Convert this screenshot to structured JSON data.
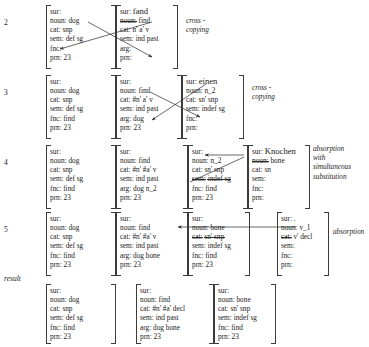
{
  "figure": {
    "kind": "derivation-table",
    "rows": [
      {
        "number": "2",
        "label": "",
        "note": "cross - copying",
        "proplists": [
          {
            "name": "dog-proplist",
            "lines": [
              {
                "key": "sur:",
                "value": ""
              },
              {
                "key": "noun:",
                "value": "dog"
              },
              {
                "key": "cat:",
                "value": "snp"
              },
              {
                "key": "sem:",
                "value": "def sg"
              },
              {
                "key": "fnc:",
                "value": ""
              },
              {
                "key": "prn:",
                "value": "23"
              }
            ]
          },
          {
            "name": "fand-proplist",
            "lines": [
              {
                "key": "sur:",
                "value": "fand",
                "value_big": true
              },
              {
                "key": "noun:",
                "value": "find",
                "key_struck": true
              },
              {
                "key": "cat:",
                "value": "n' a' v"
              },
              {
                "key": "sem:",
                "value": "ind past"
              },
              {
                "key": "arg:",
                "value": ""
              },
              {
                "key": "prn:",
                "value": ""
              }
            ]
          }
        ]
      },
      {
        "number": "3",
        "label": "",
        "note": "cross - copying",
        "proplists": [
          {
            "name": "dog-proplist",
            "lines": [
              {
                "key": "sur:",
                "value": ""
              },
              {
                "key": "noun:",
                "value": "dog"
              },
              {
                "key": "cat:",
                "value": "snp"
              },
              {
                "key": "sem:",
                "value": "def sg"
              },
              {
                "key": "fnc:",
                "value": "find"
              },
              {
                "key": "prn:",
                "value": "23"
              }
            ]
          },
          {
            "name": "find-proplist",
            "lines": [
              {
                "key": "sur:",
                "value": ""
              },
              {
                "key": "noun:",
                "value": "find"
              },
              {
                "key": "cat:",
                "value": "#n' a' v"
              },
              {
                "key": "sem:",
                "value": "ind past"
              },
              {
                "key": "arg:",
                "value": "dog"
              },
              {
                "key": "prn:",
                "value": "23"
              }
            ]
          },
          {
            "name": "einen-proplist",
            "lines": [
              {
                "key": "sur:",
                "value": "einen"
              },
              {
                "key": "noun:",
                "value": "n_2"
              },
              {
                "key": "cat:",
                "value": "sn' snp"
              },
              {
                "key": "sem:",
                "value": "indef sg"
              },
              {
                "key": "fnc:",
                "value": ""
              },
              {
                "key": "prn:",
                "value": ""
              }
            ]
          }
        ]
      },
      {
        "number": "4",
        "label": "",
        "note": "absorption with\nsimultaneous\nsubstitution",
        "proplists": [
          {
            "name": "dog-proplist",
            "lines": [
              {
                "key": "sur:",
                "value": ""
              },
              {
                "key": "noun:",
                "value": "dog"
              },
              {
                "key": "cat:",
                "value": "snp"
              },
              {
                "key": "sem:",
                "value": "def sg"
              },
              {
                "key": "fnc:",
                "value": "find"
              },
              {
                "key": "prn:",
                "value": "23"
              }
            ]
          },
          {
            "name": "find-proplist",
            "lines": [
              {
                "key": "sur:",
                "value": ""
              },
              {
                "key": "noun:",
                "value": "find"
              },
              {
                "key": "cat:",
                "value": "#n' #a' v"
              },
              {
                "key": "sem:",
                "value": "ind past"
              },
              {
                "key": "arg:",
                "value": "dog n_2"
              },
              {
                "key": "prn:",
                "value": "23"
              }
            ]
          },
          {
            "name": "n2-proplist",
            "lines": [
              {
                "key": "sur:",
                "value": ""
              },
              {
                "key": "noun:",
                "value": "n_2"
              },
              {
                "key": "cat:",
                "value": "sn' snp"
              },
              {
                "key": "sem:",
                "value": "indef sg",
                "key_struck": true,
                "value_struck": true
              },
              {
                "key": "fnc:",
                "value": "find"
              },
              {
                "key": "prn:",
                "value": "23"
              }
            ]
          },
          {
            "name": "knochen-proplist",
            "lines": [
              {
                "key": "sur:",
                "value": "Knochen",
                "value_big": true
              },
              {
                "key": "noun:",
                "value": "bone",
                "key_struck": true
              },
              {
                "key": "cat:",
                "value": "sn"
              },
              {
                "key": "sem:",
                "value": ""
              },
              {
                "key": "fnc:",
                "value": ""
              },
              {
                "key": "prn:",
                "value": ""
              }
            ]
          }
        ]
      },
      {
        "number": "5",
        "label": "",
        "note": "absorption",
        "proplists": [
          {
            "name": "dog-proplist",
            "lines": [
              {
                "key": "sur:",
                "value": ""
              },
              {
                "key": "noun:",
                "value": "dog"
              },
              {
                "key": "cat:",
                "value": "snp"
              },
              {
                "key": "sem:",
                "value": "def sg"
              },
              {
                "key": "fnc:",
                "value": "find"
              },
              {
                "key": "prn:",
                "value": "23"
              }
            ]
          },
          {
            "name": "find-proplist",
            "lines": [
              {
                "key": "sur:",
                "value": ""
              },
              {
                "key": "noun:",
                "value": "find"
              },
              {
                "key": "cat:",
                "value": "#n' #a' v"
              },
              {
                "key": "sem:",
                "value": "ind past"
              },
              {
                "key": "arg:",
                "value": "dog bone"
              },
              {
                "key": "prn:",
                "value": "23"
              }
            ]
          },
          {
            "name": "bone-proplist",
            "lines": [
              {
                "key": "sur:",
                "value": ""
              },
              {
                "key": "noun:",
                "value": "bone"
              },
              {
                "key": "cat:",
                "value": "sn' snp",
                "key_struck": true,
                "value_struck": true
              },
              {
                "key": "sem:",
                "value": "indef sg"
              },
              {
                "key": "fnc:",
                "value": "find"
              },
              {
                "key": "prn:",
                "value": "23"
              }
            ]
          },
          {
            "name": "v1-proplist",
            "lines": [
              {
                "key": "sur:",
                "value": "."
              },
              {
                "key": "noun:",
                "value": "v_1"
              },
              {
                "key": "cat:",
                "value": "v' decl",
                "key_struck": true
              },
              {
                "key": "sem:",
                "value": ""
              },
              {
                "key": "fnc:",
                "value": ""
              },
              {
                "key": "prn:",
                "value": ""
              }
            ]
          }
        ]
      },
      {
        "number": "",
        "label": "result",
        "note": "",
        "proplists": [
          {
            "name": "dog-proplist",
            "lines": [
              {
                "key": "sur:",
                "value": ""
              },
              {
                "key": "noun:",
                "value": "dog"
              },
              {
                "key": "cat:",
                "value": "snp"
              },
              {
                "key": "sem:",
                "value": "def sg"
              },
              {
                "key": "fnc:",
                "value": "find"
              },
              {
                "key": "prn:",
                "value": "23"
              }
            ]
          },
          {
            "name": "find-proplist",
            "lines": [
              {
                "key": "sur:",
                "value": ""
              },
              {
                "key": "noun:",
                "value": "find"
              },
              {
                "key": "cat:",
                "value": "#n' #a' decl"
              },
              {
                "key": "sem:",
                "value": "ind past"
              },
              {
                "key": "arg:",
                "value": "dog bone"
              },
              {
                "key": "prn:",
                "value": "23"
              }
            ]
          },
          {
            "name": "bone-proplist",
            "lines": [
              {
                "key": "sur:",
                "value": ""
              },
              {
                "key": "noun:",
                "value": "bone"
              },
              {
                "key": "cat:",
                "value": "sn' snp"
              },
              {
                "key": "sem:",
                "value": "indef sg"
              },
              {
                "key": "fnc:",
                "value": "find"
              },
              {
                "key": "prn:",
                "value": "23"
              }
            ]
          }
        ]
      }
    ]
  },
  "colors": {
    "ink": "#1a1a1a",
    "bracket": "#3b3b3b",
    "page": "#ffffff"
  }
}
